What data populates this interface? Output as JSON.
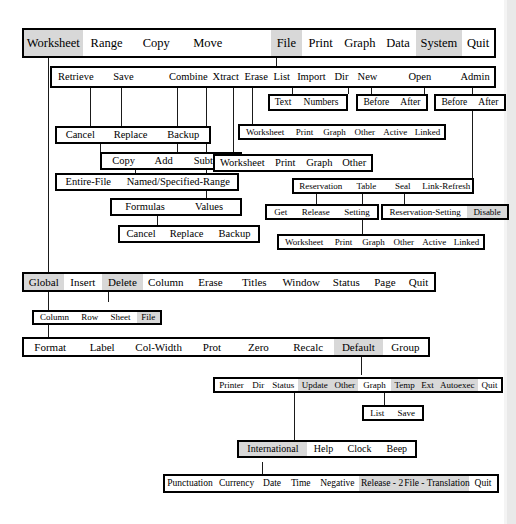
{
  "diagram": {
    "colors": {
      "line": "#1a1a1a",
      "box_border": "#000000",
      "highlight": "#d8d8d8",
      "background": "#ffffff"
    }
  },
  "bars": [
    {
      "id": "main-menu",
      "items": [
        {
          "label": "Worksheet",
          "hl": true,
          "w": 64
        },
        {
          "label": "Range",
          "hl": false,
          "w": 52
        },
        {
          "label": "Copy",
          "hl": false,
          "w": 56
        },
        {
          "label": "Move",
          "hl": false,
          "w": 56
        },
        {
          "label": "",
          "hl": false,
          "w": 40
        },
        {
          "label": "File",
          "hl": true,
          "w": 33
        },
        {
          "label": "Print",
          "hl": false,
          "w": 40
        },
        {
          "label": "Graph",
          "hl": false,
          "w": 44
        },
        {
          "label": "Data",
          "hl": false,
          "w": 38
        },
        {
          "label": "System",
          "hl": true,
          "w": 50
        },
        {
          "label": "Quit",
          "hl": false,
          "w": 34
        }
      ]
    },
    {
      "id": "file-menu",
      "items": [
        {
          "label": "Retrieve",
          "hl": false,
          "w": 56
        },
        {
          "label": "Save",
          "hl": false,
          "w": 56
        },
        {
          "label": "",
          "hl": false,
          "w": 22
        },
        {
          "label": "Combine",
          "hl": false,
          "w": 50
        },
        {
          "label": "Xtract",
          "hl": false,
          "w": 37
        },
        {
          "label": "Erase",
          "hl": false,
          "w": 33
        },
        {
          "label": "List",
          "hl": false,
          "w": 25
        },
        {
          "label": "Import",
          "hl": false,
          "w": 43
        },
        {
          "label": "Dir",
          "hl": false,
          "w": 26
        },
        {
          "label": "New",
          "hl": false,
          "w": 33
        },
        {
          "label": "",
          "hl": false,
          "w": 22
        },
        {
          "label": "Open",
          "hl": false,
          "w": 42
        },
        {
          "label": "",
          "hl": false,
          "w": 20
        },
        {
          "label": "Admin",
          "hl": false,
          "w": 44
        }
      ]
    },
    {
      "id": "import-menu",
      "items": [
        {
          "label": "Text",
          "hl": false,
          "w": 26
        },
        {
          "label": "Numbers",
          "hl": false,
          "w": 52
        }
      ]
    },
    {
      "id": "dir-new-menu",
      "items": [
        {
          "label": "Before",
          "hl": false,
          "w": 38
        },
        {
          "label": "After",
          "hl": false,
          "w": 32
        }
      ]
    },
    {
      "id": "open-menu",
      "items": [
        {
          "label": "Before",
          "hl": false,
          "w": 38
        },
        {
          "label": "After",
          "hl": false,
          "w": 32
        }
      ]
    },
    {
      "id": "list-menu",
      "items": [
        {
          "label": "Worksheet",
          "hl": false,
          "w": 51
        },
        {
          "label": "Print",
          "hl": false,
          "w": 28
        },
        {
          "label": "Graph",
          "hl": false,
          "w": 31
        },
        {
          "label": "Other",
          "hl": false,
          "w": 29
        },
        {
          "label": "Active",
          "hl": false,
          "w": 31
        },
        {
          "label": "Linked",
          "hl": false,
          "w": 33
        }
      ]
    },
    {
      "id": "save-menu",
      "items": [
        {
          "label": "Cancel",
          "hl": false,
          "w": 46
        },
        {
          "label": "Replace",
          "hl": false,
          "w": 54
        },
        {
          "label": "Backup",
          "hl": false,
          "w": 51
        }
      ]
    },
    {
      "id": "combine-menu",
      "items": [
        {
          "label": "Copy",
          "hl": false,
          "w": 42
        },
        {
          "label": "Add",
          "hl": false,
          "w": 36
        },
        {
          "label": "Subtract",
          "hl": false,
          "w": 57
        }
      ]
    },
    {
      "id": "erase-menu",
      "items": [
        {
          "label": "Worksheet",
          "hl": false,
          "w": 55
        },
        {
          "label": "Print",
          "hl": false,
          "w": 31
        },
        {
          "label": "Graph",
          "hl": false,
          "w": 36
        },
        {
          "label": "Other",
          "hl": false,
          "w": 33
        }
      ]
    },
    {
      "id": "combine-type-menu",
      "items": [
        {
          "label": "Entire-File",
          "hl": false,
          "w": 62
        },
        {
          "label": "Named/Specified-Range",
          "hl": false,
          "w": 118
        }
      ]
    },
    {
      "id": "admin-menu",
      "items": [
        {
          "label": "Reservation",
          "hl": false,
          "w": 64
        },
        {
          "label": "Table",
          "hl": false,
          "w": 45
        },
        {
          "label": "Seal",
          "hl": false,
          "w": 41
        },
        {
          "label": "Link-Refresh",
          "hl": false,
          "w": 62
        }
      ]
    },
    {
      "id": "xtract-menu",
      "items": [
        {
          "label": "Formulas",
          "hl": false,
          "w": 66
        },
        {
          "label": "Values",
          "hl": false,
          "w": 62
        }
      ]
    },
    {
      "id": "reservation-menu",
      "items": [
        {
          "label": "Get",
          "hl": false,
          "w": 27
        },
        {
          "label": "Release",
          "hl": false,
          "w": 43
        },
        {
          "label": "Setting",
          "hl": false,
          "w": 40
        }
      ]
    },
    {
      "id": "seal-menu",
      "items": [
        {
          "label": "Reservation-Setting",
          "hl": false,
          "w": 85
        },
        {
          "label": "Disable",
          "hl": true,
          "w": 39
        }
      ]
    },
    {
      "id": "xtract-file-menu",
      "items": [
        {
          "label": "Cancel",
          "hl": false,
          "w": 42
        },
        {
          "label": "Replace",
          "hl": false,
          "w": 49
        },
        {
          "label": "Backup",
          "hl": false,
          "w": 47
        }
      ]
    },
    {
      "id": "table-menu",
      "items": [
        {
          "label": "Worksheet",
          "hl": false,
          "w": 51
        },
        {
          "label": "Print",
          "hl": false,
          "w": 28
        },
        {
          "label": "Graph",
          "hl": false,
          "w": 31
        },
        {
          "label": "Other",
          "hl": false,
          "w": 29
        },
        {
          "label": "Active",
          "hl": false,
          "w": 31
        },
        {
          "label": "Linked",
          "hl": false,
          "w": 33
        }
      ]
    },
    {
      "id": "worksheet-menu",
      "items": [
        {
          "label": "Global",
          "hl": true,
          "w": 44
        },
        {
          "label": "Insert",
          "hl": false,
          "w": 43
        },
        {
          "label": "Delete",
          "hl": true,
          "w": 45
        },
        {
          "label": "Column",
          "hl": false,
          "w": 52
        },
        {
          "label": "Erase",
          "hl": false,
          "w": 48
        },
        {
          "label": "Titles",
          "hl": false,
          "w": 50
        },
        {
          "label": "Window",
          "hl": false,
          "w": 55
        },
        {
          "label": "Status",
          "hl": false,
          "w": 46
        },
        {
          "label": "Page",
          "hl": false,
          "w": 40
        },
        {
          "label": "Quit",
          "hl": false,
          "w": 34
        }
      ]
    },
    {
      "id": "insert-delete-menu",
      "items": [
        {
          "label": "Column",
          "hl": false,
          "w": 40
        },
        {
          "label": "Row",
          "hl": false,
          "w": 28
        },
        {
          "label": "Sheet",
          "hl": false,
          "w": 31
        },
        {
          "label": "File",
          "hl": true,
          "w": 22
        }
      ]
    },
    {
      "id": "global-menu",
      "items": [
        {
          "label": "Format",
          "hl": false,
          "w": 56
        },
        {
          "label": "Label",
          "hl": false,
          "w": 55
        },
        {
          "label": "Col-Width",
          "hl": false,
          "w": 66
        },
        {
          "label": "Prot",
          "hl": false,
          "w": 48
        },
        {
          "label": "Zero",
          "hl": false,
          "w": 51
        },
        {
          "label": "Recalc",
          "hl": false,
          "w": 55
        },
        {
          "label": "Default",
          "hl": true,
          "w": 52
        },
        {
          "label": "Group",
          "hl": false,
          "w": 48
        }
      ]
    },
    {
      "id": "default-menu",
      "items": [
        {
          "label": "Printer",
          "hl": false,
          "w": 37
        },
        {
          "label": "Dir",
          "hl": false,
          "w": 22
        },
        {
          "label": "Status",
          "hl": false,
          "w": 33
        },
        {
          "label": "Update",
          "hl": true,
          "w": 37
        },
        {
          "label": "Other",
          "hl": true,
          "w": 30
        },
        {
          "label": "Graph",
          "hl": false,
          "w": 36
        },
        {
          "label": "Temp",
          "hl": true,
          "w": 31
        },
        {
          "label": "Ext",
          "hl": true,
          "w": 19
        },
        {
          "label": "Autoexec",
          "hl": true,
          "w": 47
        },
        {
          "label": "Quit",
          "hl": false,
          "w": 25
        }
      ]
    },
    {
      "id": "temp-menu",
      "items": [
        {
          "label": "List",
          "hl": false,
          "w": 24
        },
        {
          "label": "Save",
          "hl": false,
          "w": 29
        }
      ]
    },
    {
      "id": "other-menu",
      "items": [
        {
          "label": "International",
          "hl": true,
          "w": 67
        },
        {
          "label": "Help",
          "hl": false,
          "w": 32
        },
        {
          "label": "Clock",
          "hl": false,
          "w": 37
        },
        {
          "label": "Beep",
          "hl": false,
          "w": 35
        }
      ]
    },
    {
      "id": "international-menu",
      "items": [
        {
          "label": "Punctuation",
          "hl": false,
          "w": 63
        },
        {
          "label": "Currency",
          "hl": false,
          "w": 54
        },
        {
          "label": "Date",
          "hl": false,
          "w": 34
        },
        {
          "label": "Time",
          "hl": false,
          "w": 36
        },
        {
          "label": "Negative",
          "hl": false,
          "w": 55
        },
        {
          "label": "Release - 2",
          "hl": true,
          "w": 57
        },
        {
          "label": "File - Translation",
          "hl": true,
          "w": 77
        },
        {
          "label": "Quit",
          "hl": false,
          "w": 34
        }
      ]
    }
  ]
}
